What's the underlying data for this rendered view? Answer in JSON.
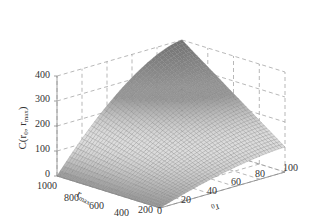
{
  "chart_data": {
    "type": "surface3d",
    "title": "",
    "xlabel": "r0",
    "ylabel": "r_max",
    "zlabel": "C(r0, r_max)",
    "x_ticks": [
      0,
      20,
      40,
      60,
      80,
      100
    ],
    "y_ticks": [
      200,
      400,
      600,
      800,
      1000
    ],
    "z_ticks": [
      0,
      100,
      200,
      300,
      400
    ],
    "xlim": [
      0,
      100
    ],
    "ylim": [
      200,
      1000
    ],
    "zlim": [
      0,
      400
    ],
    "grid": true,
    "colormap": "gray",
    "corner_values": [
      {
        "r0": 0,
        "r_max": 200,
        "C": 0
      },
      {
        "r0": 0,
        "r_max": 1000,
        "C": 0
      },
      {
        "r0": 100,
        "r_max": 200,
        "C": 100
      },
      {
        "r0": 100,
        "r_max": 1000,
        "C": 400
      }
    ]
  },
  "labels": {
    "z_axis": "C(r",
    "z_sub0": "0",
    "z_sep": ", r",
    "z_sub1": "max",
    "z_close": ")",
    "y_axis": "r",
    "y_sub": "max",
    "x_axis": "r",
    "x_sub": "0"
  },
  "ticks": {
    "z": [
      "0",
      "100",
      "200",
      "300",
      "400"
    ],
    "y": [
      "1000",
      "800",
      "600",
      "400",
      "200"
    ],
    "x": [
      "0",
      "20",
      "40",
      "60",
      "80",
      "100"
    ]
  }
}
